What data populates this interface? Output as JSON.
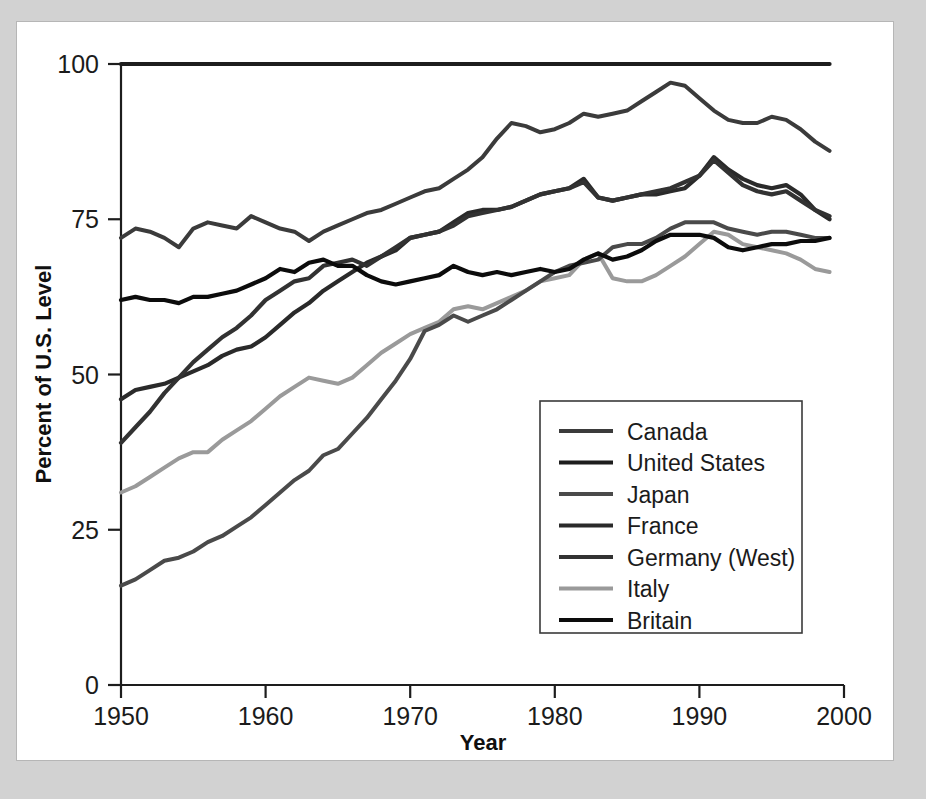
{
  "figure": {
    "background_color": "#d2d2d2",
    "card_color": "#ffffff",
    "card_border_color": "#b6b6b6"
  },
  "chart_data": {
    "type": "line",
    "title": "",
    "xlabel": "Year",
    "ylabel": "Percent of U.S. Level",
    "xlim": [
      1950,
      2000
    ],
    "ylim": [
      0,
      100
    ],
    "xticks": [
      1950,
      1960,
      1970,
      1980,
      1990,
      2000
    ],
    "xticklabels": [
      "1950",
      "1960",
      "1970",
      "1980",
      "1990",
      "2000"
    ],
    "yticks": [
      0,
      25,
      50,
      75,
      100
    ],
    "yticklabels": [
      "0",
      "25",
      "50",
      "75",
      "100"
    ],
    "grid": false,
    "legend_position": "lower right",
    "x": [
      1950,
      1951,
      1952,
      1953,
      1954,
      1955,
      1956,
      1957,
      1958,
      1959,
      1960,
      1961,
      1962,
      1963,
      1964,
      1965,
      1966,
      1967,
      1968,
      1969,
      1970,
      1971,
      1972,
      1973,
      1974,
      1975,
      1976,
      1977,
      1978,
      1979,
      1980,
      1981,
      1982,
      1983,
      1984,
      1985,
      1986,
      1987,
      1988,
      1989,
      1990,
      1991,
      1992,
      1993,
      1994,
      1995,
      1996,
      1997,
      1998,
      1999
    ],
    "series": [
      {
        "name": "Canada",
        "color": "#3b3b3b",
        "width": 4.0,
        "values": [
          72,
          73.5,
          73,
          72,
          70.5,
          73.5,
          74.5,
          74,
          73.5,
          75.5,
          74.5,
          73.5,
          73,
          71.5,
          73,
          74,
          75,
          76,
          76.5,
          77.5,
          78.5,
          79.5,
          80,
          81.5,
          83,
          85,
          88,
          90.5,
          90,
          89,
          89.5,
          90.5,
          92,
          91.5,
          92,
          92.5,
          94,
          95.5,
          97,
          96.5,
          94.5,
          92.5,
          91,
          90.5,
          90.5,
          91.5,
          91,
          89.5,
          87.5,
          86
        ]
      },
      {
        "name": "United States",
        "color": "#1d1d1d",
        "width": 4.2,
        "values": [
          100,
          100,
          100,
          100,
          100,
          100,
          100,
          100,
          100,
          100,
          100,
          100,
          100,
          100,
          100,
          100,
          100,
          100,
          100,
          100,
          100,
          100,
          100,
          100,
          100,
          100,
          100,
          100,
          100,
          100,
          100,
          100,
          100,
          100,
          100,
          100,
          100,
          100,
          100,
          100,
          100,
          100,
          100,
          100,
          100,
          100,
          100,
          100,
          100,
          100
        ]
      },
      {
        "name": "Japan",
        "color": "#4a4a4a",
        "width": 4.0,
        "values": [
          16,
          17,
          18.5,
          20,
          20.5,
          21.5,
          23,
          24,
          25.5,
          27,
          29,
          31,
          33,
          34.5,
          37,
          38,
          40.5,
          43,
          46,
          49,
          52.5,
          57,
          58,
          59.5,
          58.5,
          59.5,
          60.5,
          62,
          63.5,
          65,
          66.5,
          67.5,
          68,
          68.5,
          70.5,
          71,
          71,
          72,
          73.5,
          74.5,
          74.5,
          74.5,
          73.5,
          73,
          72.5,
          73,
          73,
          72.5,
          72,
          72
        ]
      },
      {
        "name": "France",
        "color": "#2a2a2a",
        "width": 4.2,
        "values": [
          46,
          47.5,
          48,
          48.5,
          49.5,
          50.5,
          51.5,
          53,
          54,
          54.5,
          56,
          58,
          60,
          61.5,
          63.5,
          65,
          66.5,
          68,
          69,
          70,
          72,
          72.5,
          73,
          74.5,
          76,
          76.5,
          76.5,
          77,
          78,
          79,
          79.5,
          80,
          81.5,
          78.5,
          78,
          78.5,
          79,
          79,
          79.5,
          80,
          82,
          85,
          83,
          81.5,
          80.5,
          80,
          80.5,
          79,
          76.5,
          75
        ]
      },
      {
        "name": "Germany (West)",
        "color": "#323232",
        "width": 4.2,
        "values": [
          39,
          41.5,
          44,
          47,
          49.5,
          52,
          54,
          56,
          57.5,
          59.5,
          62,
          63.5,
          65,
          65.5,
          67.5,
          68,
          68.5,
          67.5,
          69,
          70.5,
          72,
          72.5,
          73,
          74,
          75.5,
          76,
          76.5,
          77,
          78,
          79,
          79.5,
          80,
          81,
          78.5,
          78,
          78.5,
          79,
          79.5,
          80,
          81,
          82,
          84.5,
          82.5,
          80.5,
          79.5,
          79,
          79.5,
          78,
          76.5,
          75.5
        ]
      },
      {
        "name": "Italy",
        "color": "#9a9a9a",
        "width": 4.0,
        "values": [
          31,
          32,
          33.5,
          35,
          36.5,
          37.5,
          37.5,
          39.5,
          41,
          42.5,
          44.5,
          46.5,
          48,
          49.5,
          49,
          48.5,
          49.5,
          51.5,
          53.5,
          55,
          56.5,
          57.5,
          58.5,
          60.5,
          61,
          60.5,
          61.5,
          62.5,
          63.5,
          65,
          65.5,
          66,
          68.5,
          69.5,
          65.5,
          65,
          65,
          66,
          67.5,
          69,
          71,
          73,
          72.5,
          71,
          70.5,
          70,
          69.5,
          68.5,
          67,
          66.5
        ]
      },
      {
        "name": "Britain",
        "color": "#0c0c0c",
        "width": 4.2,
        "values": [
          62,
          62.5,
          62,
          62,
          61.5,
          62.5,
          62.5,
          63,
          63.5,
          64.5,
          65.5,
          67,
          66.5,
          68,
          68.5,
          67.5,
          67.5,
          66,
          65,
          64.5,
          65,
          65.5,
          66,
          67.5,
          66.5,
          66,
          66.5,
          66,
          66.5,
          67,
          66.5,
          67,
          68.5,
          69.5,
          68.5,
          69,
          70,
          71.5,
          72.5,
          72.5,
          72.5,
          72,
          70.5,
          70,
          70.5,
          71,
          71,
          71.5,
          71.5,
          72
        ]
      }
    ]
  },
  "legend": {
    "entries": [
      {
        "label": "Canada"
      },
      {
        "label": "United States"
      },
      {
        "label": "Japan"
      },
      {
        "label": "France"
      },
      {
        "label": "Germany (West)"
      },
      {
        "label": "Italy"
      },
      {
        "label": "Britain"
      }
    ]
  }
}
